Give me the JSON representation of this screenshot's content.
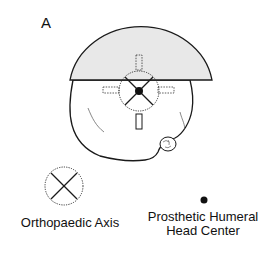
{
  "figure": {
    "panel_label": "A",
    "colors": {
      "cap_fill": "#e8e8e8",
      "stroke": "#1a1a1a"
    },
    "diagram": {
      "humeral_head_cap": "semicircle",
      "orthopaedic_axis_symbol": "dotted-circle-with-x",
      "head_center_symbol": "filled-dot",
      "prosthesis_fins": 4
    }
  },
  "legend": {
    "items": [
      {
        "symbol": "dotted-circle-x-icon",
        "label": "Orthopaedic Axis"
      },
      {
        "symbol": "filled-dot-icon",
        "label": "Prosthetic Humeral Head Center"
      }
    ],
    "orthopaedic_axis": "Orthopaedic Axis",
    "head_center_line1": "Prosthetic Humeral",
    "head_center_line2": "Head Center"
  }
}
